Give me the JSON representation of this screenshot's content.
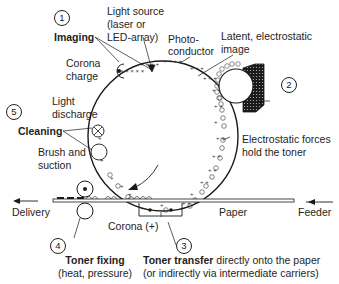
{
  "diagram": {
    "type": "laser printer electrophotographic process",
    "steps": [
      {
        "number": "1",
        "label": "Imaging"
      },
      {
        "number": "2",
        "label": "Developing"
      },
      {
        "number": "3",
        "label": "Toner transfer"
      },
      {
        "number": "4",
        "label": "Toner fixing"
      },
      {
        "number": "5",
        "label": "Cleaning"
      }
    ]
  },
  "labels": {
    "step1_num": "1",
    "step2_num": "2",
    "step3_num": "3",
    "step4_num": "4",
    "step5_num": "5",
    "light_source_1": "Light source",
    "light_source_2": "(laser or",
    "light_source_3": "LED-array)",
    "imaging": "Imaging",
    "corona_charge_1": "Corona",
    "corona_charge_2": "charge",
    "photoconductor_1": "Photo-",
    "photoconductor_2": "conductor",
    "latent_image_1": "Latent, electrostatic",
    "latent_image_2": "image",
    "light_discharge_1": "Light",
    "light_discharge_2": "discharge",
    "cleaning": "Cleaning",
    "brush_1": "Brush and",
    "brush_2": "suction",
    "electrostatic_1": "Electrostatic forces",
    "electrostatic_2": "hold the toner",
    "delivery": "Delivery",
    "feeder": "Feeder",
    "paper": "Paper",
    "corona_plus": "Corona (+)",
    "toner_fixing": "Toner fixing",
    "toner_fixing_sub": "(heat, pressure)",
    "toner_transfer_bold": "Toner transfer",
    "toner_transfer_rest": " directly onto the paper",
    "toner_transfer_sub": "(or indirectly via intermediate carriers)"
  }
}
